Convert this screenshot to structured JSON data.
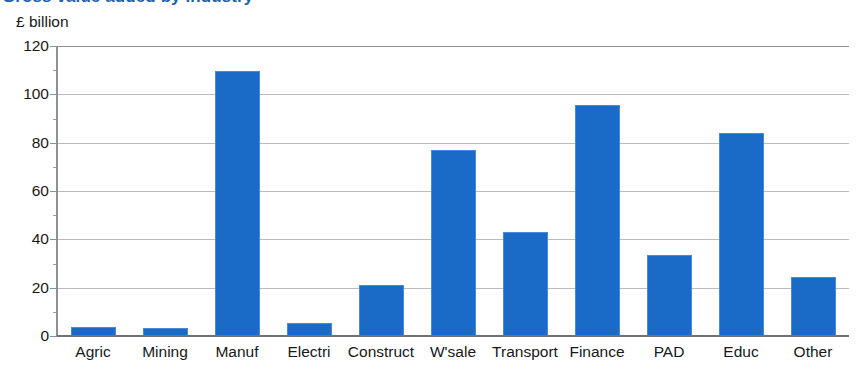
{
  "title": "Gross value added by industry",
  "axis_unit_caption": "£ billion",
  "colors": {
    "bar_fill": "#1a6ac8",
    "bar_edge": "#4a8ad8",
    "gridline": "#b9bbbd",
    "axis": "#8e9194",
    "text": "#16181a",
    "title": "#1f5fb0"
  },
  "chart_data": {
    "type": "bar",
    "title": "Gross value added by industry",
    "xlabel": "",
    "ylabel": "£ billion",
    "ylim": [
      0,
      120
    ],
    "ytick_values": [
      0,
      20,
      40,
      60,
      80,
      100,
      120
    ],
    "ytick_labels": [
      "0",
      "20",
      "40",
      "60",
      "80",
      "100",
      "120"
    ],
    "minor_tick_interval": 10,
    "grid": "horizontal",
    "legend": "none",
    "categories": [
      "Agric",
      "Mining",
      "Manuf",
      "Electri",
      "Construct",
      "W'sale",
      "Transport",
      "Finance",
      "PAD",
      "Educ",
      "Other"
    ],
    "values": [
      3.7,
      3.3,
      109.5,
      5.5,
      21,
      77,
      43,
      95.5,
      33.5,
      84,
      24.5
    ]
  }
}
